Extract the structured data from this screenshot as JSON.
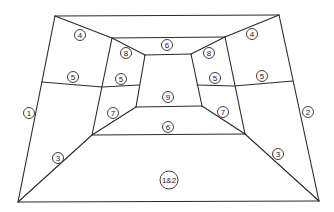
{
  "diagram": {
    "stroke_color": "#2a2a2a",
    "background": "#ffffff",
    "vertices": {
      "outer_tl": [
        55,
        16
      ],
      "outer_tr": [
        279,
        15
      ],
      "outer_bl": [
        18,
        202
      ],
      "outer_br": [
        319,
        201
      ],
      "mid_tl": [
        112,
        38
      ],
      "mid_tr": [
        225,
        37
      ],
      "mid_bl": [
        92,
        135
      ],
      "mid_br": [
        245,
        134
      ],
      "inner_tl": [
        145,
        55
      ],
      "inner_tr": [
        191,
        54
      ],
      "inner_bl": [
        136,
        107
      ],
      "inner_br": [
        202,
        106
      ]
    },
    "lines": [
      {
        "id": "outer-top",
        "points": [
          [
            55,
            16
          ],
          [
            279,
            15
          ]
        ]
      },
      {
        "id": "outer-left",
        "points": [
          [
            55,
            16
          ],
          [
            18,
            202
          ]
        ]
      },
      {
        "id": "outer-right",
        "points": [
          [
            279,
            15
          ],
          [
            319,
            201
          ]
        ]
      },
      {
        "id": "outer-bottom",
        "points": [
          [
            18,
            202
          ],
          [
            319,
            201
          ]
        ]
      },
      {
        "id": "diag-tl",
        "points": [
          [
            55,
            16
          ],
          [
            112,
            38
          ],
          [
            145,
            55
          ]
        ]
      },
      {
        "id": "diag-tr",
        "points": [
          [
            279,
            15
          ],
          [
            225,
            37
          ],
          [
            191,
            54
          ]
        ]
      },
      {
        "id": "diag-bl",
        "points": [
          [
            18,
            202
          ],
          [
            92,
            135
          ],
          [
            136,
            107
          ]
        ]
      },
      {
        "id": "diag-br",
        "points": [
          [
            319,
            201
          ],
          [
            245,
            134
          ],
          [
            202,
            106
          ]
        ]
      },
      {
        "id": "mid-top",
        "points": [
          [
            112,
            38
          ],
          [
            225,
            37
          ]
        ]
      },
      {
        "id": "mid-left",
        "points": [
          [
            112,
            38
          ],
          [
            92,
            135
          ]
        ]
      },
      {
        "id": "mid-right",
        "points": [
          [
            225,
            37
          ],
          [
            245,
            134
          ]
        ]
      },
      {
        "id": "mid-bottom",
        "points": [
          [
            92,
            135
          ],
          [
            245,
            134
          ]
        ]
      },
      {
        "id": "inner-top",
        "points": [
          [
            145,
            55
          ],
          [
            191,
            54
          ]
        ]
      },
      {
        "id": "inner-left",
        "points": [
          [
            145,
            55
          ],
          [
            136,
            107
          ]
        ]
      },
      {
        "id": "inner-right",
        "points": [
          [
            191,
            54
          ],
          [
            202,
            106
          ]
        ]
      },
      {
        "id": "inner-bottom",
        "points": [
          [
            136,
            107
          ],
          [
            202,
            106
          ]
        ]
      },
      {
        "id": "split-left",
        "points": [
          [
            42,
            82
          ],
          [
            102,
            87
          ],
          [
            139,
            85
          ]
        ]
      },
      {
        "id": "split-right",
        "points": [
          [
            197,
            85
          ],
          [
            234,
            86
          ],
          [
            293,
            81
          ]
        ]
      }
    ],
    "labels": [
      {
        "id": "label-1",
        "text": "1",
        "x": 29,
        "y": 113,
        "r": 5.5
      },
      {
        "id": "label-2",
        "text": "2",
        "x": 308,
        "y": 112,
        "r": 5.5
      },
      {
        "id": "label-3-left",
        "text": "3",
        "x": 58,
        "y": 158,
        "r": 5.5
      },
      {
        "id": "label-3-right",
        "text": "3",
        "x": 278,
        "y": 154,
        "r": 5.5
      },
      {
        "id": "label-4-left",
        "text": "4",
        "x": 80,
        "y": 35,
        "r": 5.5
      },
      {
        "id": "label-4-right",
        "text": "4",
        "x": 252,
        "y": 34,
        "r": 5.5
      },
      {
        "id": "label-5-far-left",
        "text": "5",
        "x": 73,
        "y": 77,
        "r": 5.5
      },
      {
        "id": "label-5-near-left",
        "text": "5",
        "x": 121,
        "y": 79,
        "r": 5.5
      },
      {
        "id": "label-5-near-right",
        "text": "5",
        "x": 215,
        "y": 78,
        "r": 5.5
      },
      {
        "id": "label-5-far-right",
        "text": "5",
        "x": 262,
        "y": 76,
        "r": 5.5
      },
      {
        "id": "label-6-top",
        "text": "6",
        "x": 167,
        "y": 45,
        "r": 5.5
      },
      {
        "id": "label-6-bottom",
        "text": "6",
        "x": 168,
        "y": 127,
        "r": 5.5
      },
      {
        "id": "label-7-left",
        "text": "7",
        "x": 113,
        "y": 113,
        "r": 5.5
      },
      {
        "id": "label-7-right",
        "text": "7",
        "x": 223,
        "y": 112,
        "r": 5.5
      },
      {
        "id": "label-8-left",
        "text": "8",
        "x": 126,
        "y": 53,
        "r": 5.5
      },
      {
        "id": "label-8-right",
        "text": "8",
        "x": 209,
        "y": 53,
        "r": 5.5
      },
      {
        "id": "label-9",
        "text": "9",
        "x": 168,
        "y": 97,
        "r": 5.5
      },
      {
        "id": "label-1and2",
        "text": "1&2",
        "x": 169,
        "y": 180,
        "r": 9
      }
    ]
  }
}
